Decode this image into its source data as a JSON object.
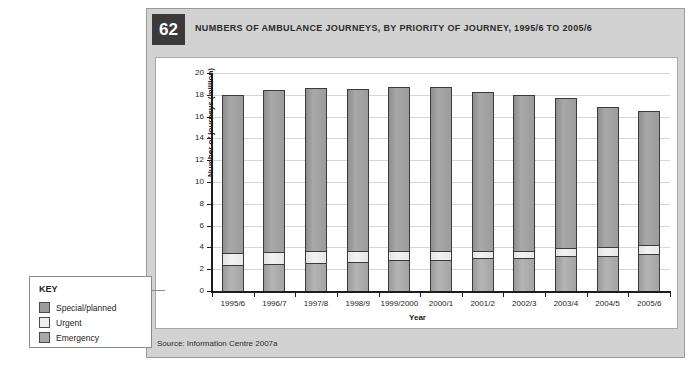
{
  "figure": {
    "number": "62",
    "title": "NUMBERS OF AMBULANCE JOURNEYS, BY PRIORITY OF JOURNEY, 1995/6 TO 2005/6",
    "source": "Source: Information Centre 2007a"
  },
  "key": {
    "heading": "KEY",
    "items": [
      {
        "label": "Special/planned",
        "color": "#9c9c9c"
      },
      {
        "label": "Urgent",
        "color": "#efefef"
      },
      {
        "label": "Emergency",
        "color": "#a8a8a8"
      }
    ]
  },
  "chart_data": {
    "type": "bar",
    "stacked": true,
    "title": "NUMBERS OF AMBULANCE JOURNEYS, BY PRIORITY OF JOURNEY, 1995/6 TO 2005/6",
    "xlabel": "Year",
    "ylabel": "Number of journeys (million)",
    "ylim": [
      0,
      20
    ],
    "yticks": [
      0,
      2,
      4,
      6,
      8,
      10,
      12,
      14,
      16,
      18,
      20
    ],
    "grid": true,
    "legend_position": "outside-left",
    "categories": [
      "1995/6",
      "1996/7",
      "1997/8",
      "1998/9",
      "1999/2000",
      "2000/1",
      "2001/2",
      "2002/3",
      "2003/4",
      "2004/5",
      "2005/6"
    ],
    "series": [
      {
        "name": "Emergency",
        "color": "#a8a8a8",
        "values": [
          2.4,
          2.5,
          2.6,
          2.7,
          2.8,
          2.85,
          3.0,
          3.05,
          3.2,
          3.25,
          3.4
        ]
      },
      {
        "name": "Urgent",
        "color": "#efefef",
        "values": [
          1.2,
          1.2,
          1.15,
          1.1,
          1.0,
          0.95,
          0.8,
          0.75,
          0.85,
          0.9,
          0.9
        ]
      },
      {
        "name": "Special/planned",
        "color": "#9c9c9c",
        "values": [
          14.4,
          14.7,
          14.85,
          14.7,
          14.9,
          14.9,
          14.5,
          14.2,
          13.65,
          12.75,
          12.2
        ]
      }
    ],
    "totals": [
      18.0,
      18.4,
      18.6,
      18.5,
      18.7,
      18.7,
      18.3,
      18.0,
      17.7,
      16.9,
      16.5
    ]
  }
}
